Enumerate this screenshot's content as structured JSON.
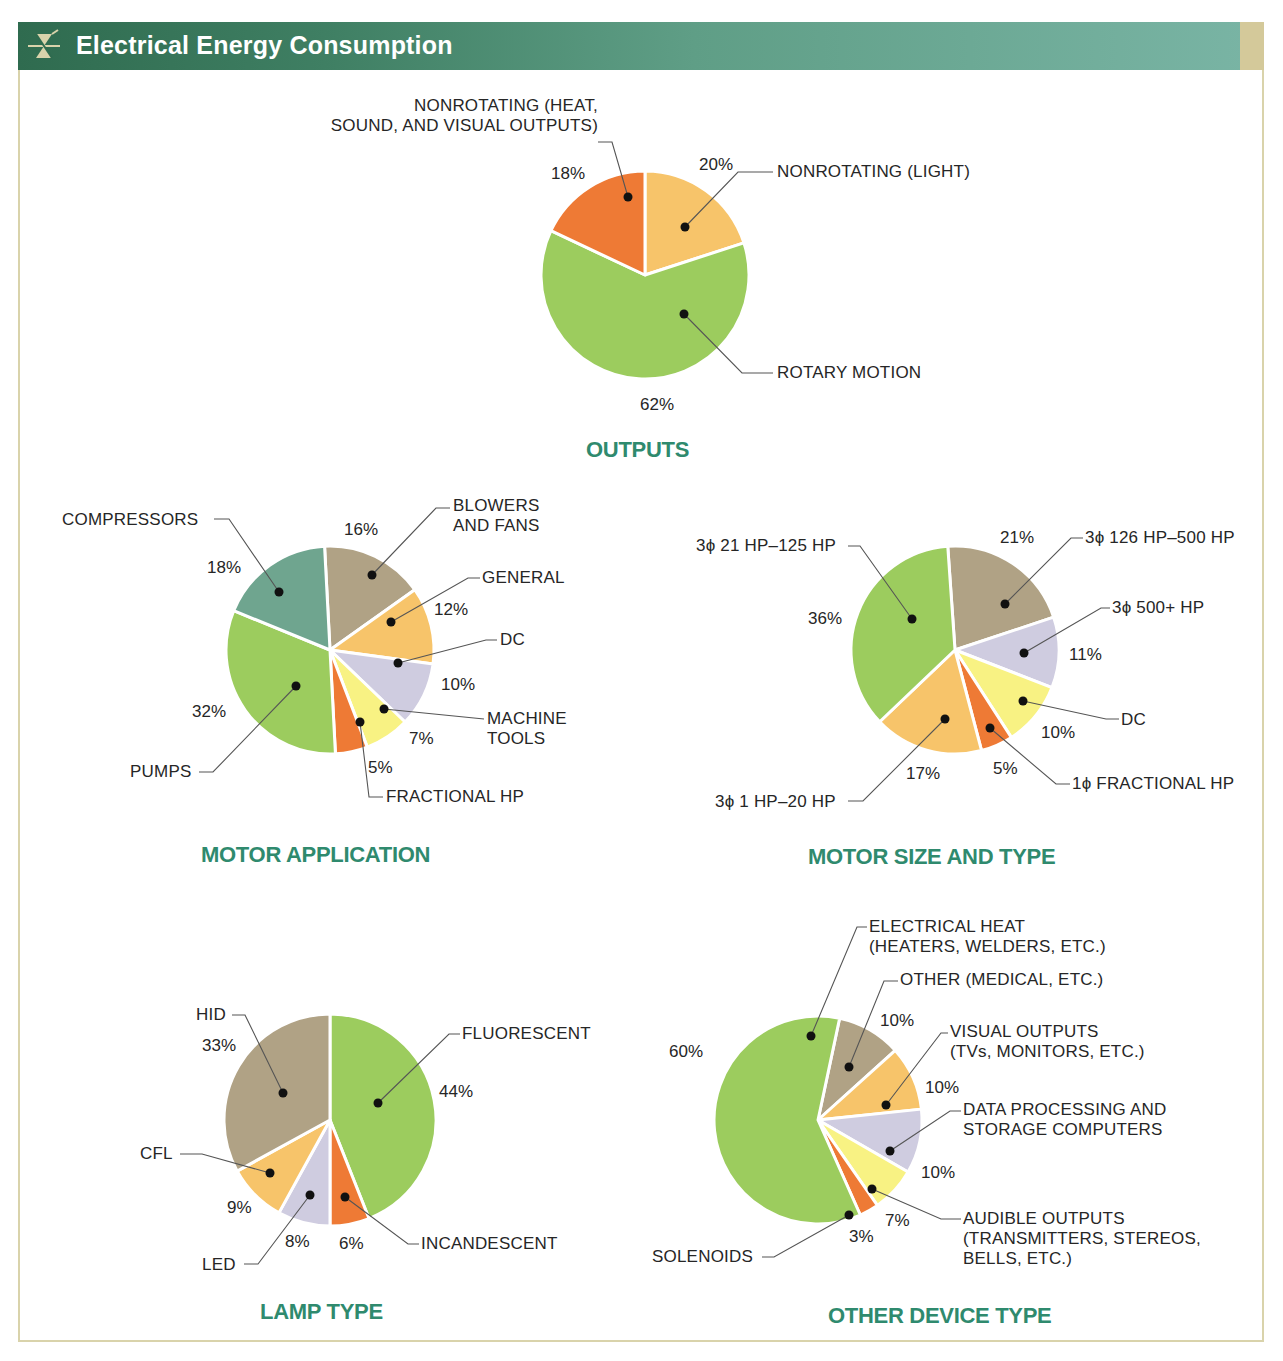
{
  "header": {
    "title": "Electrical Energy Consumption",
    "icon": "triac-symbol-icon",
    "colors": {
      "bar_start": "#2f6b4f",
      "bar_end": "#79b4a4",
      "tab": "#d4c99a",
      "frame": "#d9d3ab"
    }
  },
  "palette": {
    "green": "#9ccc5e",
    "orange_dark": "#ee7a35",
    "orange_light": "#f7c46a",
    "teal": "#6fa58f",
    "taupe": "#b0a285",
    "lavender": "#cfcce0",
    "yellow": "#f8f283",
    "title_green": "#2f8a6e"
  },
  "chart_data": [
    {
      "type": "pie",
      "title": "OUTPUTS",
      "slices": [
        {
          "label": "NONROTATING (LIGHT)",
          "value": 20,
          "color": "#f7c46a"
        },
        {
          "label": "ROTARY MOTION",
          "value": 62,
          "color": "#9ccc5e"
        },
        {
          "label": "NONROTATING (HEAT, SOUND, AND VISUAL OUTPUTS)",
          "value": 18,
          "color": "#ee7a35"
        }
      ]
    },
    {
      "type": "pie",
      "title": "MOTOR APPLICATION",
      "slices": [
        {
          "label": "BLOWERS AND FANS",
          "value": 16,
          "color": "#b0a285"
        },
        {
          "label": "GENERAL",
          "value": 12,
          "color": "#f7c46a"
        },
        {
          "label": "DC",
          "value": 10,
          "color": "#cfcce0"
        },
        {
          "label": "MACHINE TOOLS",
          "value": 7,
          "color": "#f8f283"
        },
        {
          "label": "FRACTIONAL HP",
          "value": 5,
          "color": "#ee7a35"
        },
        {
          "label": "PUMPS",
          "value": 32,
          "color": "#9ccc5e"
        },
        {
          "label": "COMPRESSORS",
          "value": 18,
          "color": "#6fa58f"
        }
      ]
    },
    {
      "type": "pie",
      "title": "MOTOR SIZE AND TYPE",
      "slices": [
        {
          "label": "3ϕ 126 HP–500 HP",
          "value": 21,
          "color": "#b0a285"
        },
        {
          "label": "3ϕ 500+ HP",
          "value": 11,
          "color": "#cfcce0"
        },
        {
          "label": "DC",
          "value": 10,
          "color": "#f8f283"
        },
        {
          "label": "1ϕ FRACTIONAL HP",
          "value": 5,
          "color": "#ee7a35"
        },
        {
          "label": "3ϕ 1 HP–20 HP",
          "value": 17,
          "color": "#f7c46a"
        },
        {
          "label": "3ϕ 21 HP–125 HP",
          "value": 36,
          "color": "#9ccc5e"
        }
      ]
    },
    {
      "type": "pie",
      "title": "LAMP TYPE",
      "slices": [
        {
          "label": "FLUORESCENT",
          "value": 44,
          "color": "#9ccc5e"
        },
        {
          "label": "INCANDESCENT",
          "value": 6,
          "color": "#ee7a35"
        },
        {
          "label": "LED",
          "value": 8,
          "color": "#cfcce0"
        },
        {
          "label": "CFL",
          "value": 9,
          "color": "#f7c46a"
        },
        {
          "label": "HID",
          "value": 33,
          "color": "#b0a285"
        }
      ]
    },
    {
      "type": "pie",
      "title": "OTHER DEVICE TYPE",
      "slices": [
        {
          "label": "OTHER (MEDICAL, ETC.)",
          "value": 10,
          "color": "#b0a285"
        },
        {
          "label": "VISUAL OUTPUTS (TVs, MONITORS, ETC.)",
          "value": 10,
          "color": "#f7c46a"
        },
        {
          "label": "DATA PROCESSING AND STORAGE COMPUTERS",
          "value": 10,
          "color": "#cfcce0"
        },
        {
          "label": "AUDIBLE OUTPUTS (TRANSMITTERS, STEREOS, BELLS, ETC.)",
          "value": 7,
          "color": "#f8f283"
        },
        {
          "label": "SOLENOIDS",
          "value": 3,
          "color": "#ee7a35"
        },
        {
          "label": "ELECTRICAL HEAT (HEATERS, WELDERS, ETC.)",
          "value": 60,
          "color": "#9ccc5e"
        }
      ]
    }
  ],
  "charts": {
    "outputs": {
      "title": "OUTPUTS",
      "labels": {
        "heat_l1": "NONROTATING (HEAT,",
        "heat_l2": "SOUND, AND VISUAL OUTPUTS)",
        "light": "NONROTATING (LIGHT)",
        "rotary": "ROTARY MOTION"
      },
      "pcts": {
        "heat": "18%",
        "light": "20%",
        "rotary": "62%"
      }
    },
    "motor_application": {
      "title": "MOTOR APPLICATION",
      "labels": {
        "compressors": "COMPRESSORS",
        "blowers_l1": "BLOWERS",
        "blowers_l2": "AND FANS",
        "general": "GENERAL",
        "dc": "DC",
        "machine_l1": "MACHINE",
        "machine_l2": "TOOLS",
        "fractional": "FRACTIONAL HP",
        "pumps": "PUMPS"
      },
      "pcts": {
        "compressors": "18%",
        "blowers": "16%",
        "general": "12%",
        "dc": "10%",
        "machine": "7%",
        "fractional": "5%",
        "pumps": "32%"
      }
    },
    "motor_size": {
      "title": "MOTOR SIZE AND TYPE",
      "labels": {
        "hp21": "3ϕ 21 HP–125 HP",
        "hp126": "3ϕ 126 HP–500 HP",
        "hp500": "3ϕ 500+ HP",
        "dc": "DC",
        "frac": "1ϕ FRACTIONAL HP",
        "hp1": "3ϕ 1 HP–20 HP"
      },
      "pcts": {
        "hp21": "36%",
        "hp126": "21%",
        "hp500": "11%",
        "dc": "10%",
        "frac": "5%",
        "hp1": "17%"
      }
    },
    "lamp_type": {
      "title": "LAMP TYPE",
      "labels": {
        "hid": "HID",
        "fluorescent": "FLUORESCENT",
        "cfl": "CFL",
        "led": "LED",
        "incandescent": "INCANDESCENT"
      },
      "pcts": {
        "hid": "33%",
        "fluorescent": "44%",
        "cfl": "9%",
        "led": "8%",
        "incandescent": "6%"
      }
    },
    "other_device": {
      "title": "OTHER DEVICE TYPE",
      "labels": {
        "heat_l1": "ELECTRICAL HEAT",
        "heat_l2": "(HEATERS, WELDERS, ETC.)",
        "other": "OTHER (MEDICAL, ETC.)",
        "visual_l1": "VISUAL OUTPUTS",
        "visual_l2": "(TVs, MONITORS, ETC.)",
        "data_l1": "DATA PROCESSING AND",
        "data_l2": "STORAGE COMPUTERS",
        "audible_l1": "AUDIBLE OUTPUTS",
        "audible_l2": "(TRANSMITTERS, STEREOS,",
        "audible_l3": "BELLS, ETC.)",
        "solenoids": "SOLENOIDS"
      },
      "pcts": {
        "heat": "60%",
        "other": "10%",
        "visual": "10%",
        "data": "10%",
        "audible": "7%",
        "solenoids": "3%"
      }
    }
  }
}
